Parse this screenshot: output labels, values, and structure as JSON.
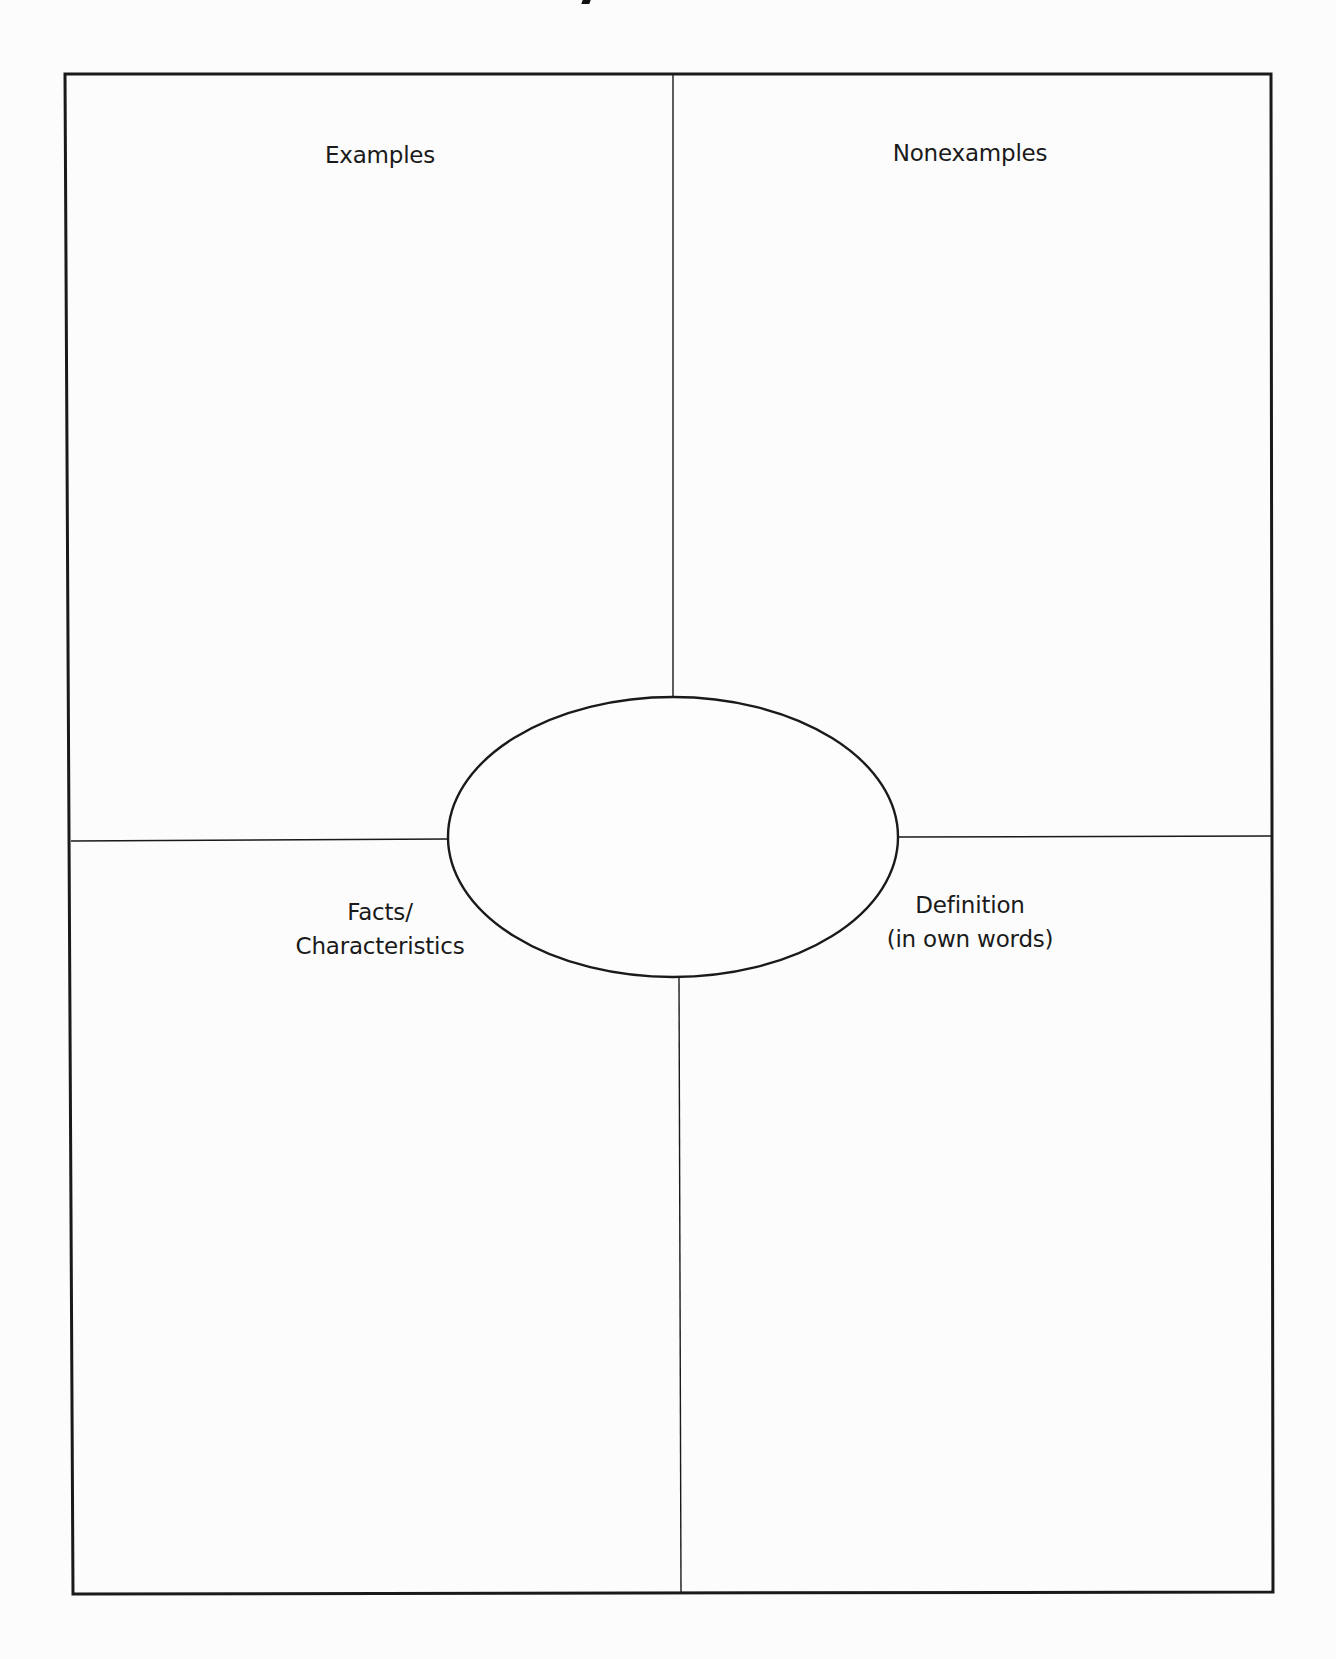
{
  "document": {
    "type": "Frayer model graphic organizer",
    "title_fragment_visible": true
  },
  "quadrants": {
    "top_left": {
      "label": "Examples"
    },
    "top_right": {
      "label": "Nonexamples"
    },
    "bottom_left": {
      "line1": "Facts/",
      "line2": "Characteristics"
    },
    "bottom_right": {
      "line1": "Definition",
      "line2": "(in own words)"
    }
  },
  "center": {
    "shape": "ellipse",
    "text": ""
  },
  "colors": {
    "background": "#fcfcfc",
    "ink": "#1a1a1a"
  }
}
